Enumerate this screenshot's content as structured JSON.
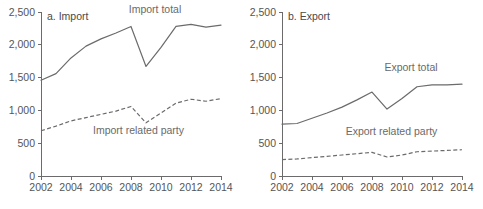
{
  "figure": {
    "background": "#ffffff",
    "line_color": "#6b6b6b",
    "text_color": "#555555"
  },
  "chart_data": [
    {
      "type": "line",
      "title": "a. Import",
      "xlabel": "",
      "ylabel": "",
      "x": [
        2002,
        2003,
        2004,
        2005,
        2006,
        2007,
        2008,
        2009,
        2010,
        2011,
        2012,
        2013,
        2014
      ],
      "xlim": [
        2002,
        2014
      ],
      "ylim": [
        0,
        2500
      ],
      "yticks": [
        0,
        500,
        1000,
        1500,
        2000,
        2500
      ],
      "ytick_labels": [
        "0",
        "500",
        "1,000",
        "1,500",
        "2,000",
        "2,500"
      ],
      "xticks": [
        2002,
        2004,
        2006,
        2008,
        2010,
        2012,
        2014
      ],
      "xtick_labels": [
        "2002",
        "2004",
        "2006",
        "2008",
        "2010",
        "2012",
        "2014"
      ],
      "grid": false,
      "legend": "inline-annotations",
      "series": [
        {
          "name": "Import total",
          "style": "solid",
          "label_x": 2009.6,
          "label_y": 2480,
          "values": [
            1460,
            1560,
            1800,
            1980,
            2090,
            2180,
            2280,
            1670,
            1960,
            2280,
            2310,
            2270,
            2300
          ]
        },
        {
          "name": "Import related party",
          "style": "dashed",
          "label_x": 2008.5,
          "label_y": 640,
          "values": [
            690,
            760,
            840,
            890,
            940,
            990,
            1060,
            810,
            960,
            1110,
            1170,
            1140,
            1180
          ]
        }
      ]
    },
    {
      "type": "line",
      "title": "b. Export",
      "xlabel": "",
      "ylabel": "",
      "x": [
        2002,
        2003,
        2004,
        2005,
        2006,
        2007,
        2008,
        2009,
        2010,
        2011,
        2012,
        2013,
        2014
      ],
      "xlim": [
        2002,
        2014
      ],
      "ylim": [
        0,
        2500
      ],
      "yticks": [
        0,
        500,
        1000,
        1500,
        2000,
        2500
      ],
      "ytick_labels": [
        "0",
        "500",
        "1,000",
        "1,500",
        "2,000",
        "2,500"
      ],
      "xticks": [
        2002,
        2004,
        2006,
        2008,
        2010,
        2012,
        2014
      ],
      "xtick_labels": [
        "2002",
        "2004",
        "2006",
        "2008",
        "2010",
        "2012",
        "2014"
      ],
      "grid": false,
      "legend": "inline-annotations",
      "series": [
        {
          "name": "Export total",
          "style": "solid",
          "label_x": 2010.6,
          "label_y": 1600,
          "values": [
            790,
            800,
            880,
            960,
            1050,
            1160,
            1280,
            1020,
            1180,
            1360,
            1390,
            1390,
            1400
          ]
        },
        {
          "name": "Export related party",
          "style": "dashed",
          "label_x": 2009.3,
          "label_y": 620,
          "values": [
            250,
            260,
            280,
            300,
            320,
            340,
            360,
            290,
            320,
            370,
            380,
            390,
            400
          ]
        }
      ]
    }
  ]
}
